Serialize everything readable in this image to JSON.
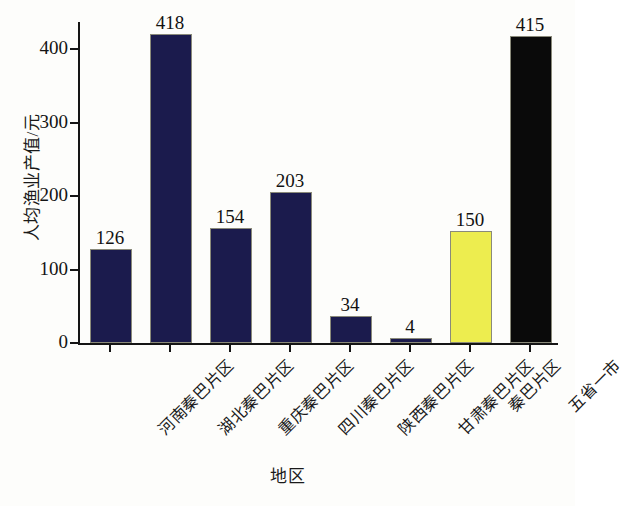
{
  "chart_data": {
    "type": "bar",
    "title": "",
    "xlabel": "地区",
    "ylabel": "人均渔业产值/元",
    "categories": [
      "河南秦巴片区",
      "湖北秦巴片区",
      "重庆秦巴片区",
      "四川秦巴片区",
      "陕西秦巴片区",
      "甘肃秦巴片区",
      "秦巴片区",
      "五省一市"
    ],
    "values": [
      126,
      418,
      154,
      203,
      34,
      4,
      150,
      415
    ],
    "value_labels": [
      "126",
      "418",
      "154",
      "203",
      "34",
      "4",
      "150",
      "415"
    ],
    "bar_colors": [
      "#1b1b4d",
      "#1b1b4d",
      "#1b1b4d",
      "#1b1b4d",
      "#1b1b4d",
      "#1b1b4d",
      "#eded4f",
      "#0a0a0a"
    ],
    "ylim": [
      0,
      440
    ],
    "yticks": [
      0,
      100,
      200,
      300,
      400
    ],
    "ytick_labels": [
      "0",
      "100",
      "200",
      "300",
      "400"
    ],
    "grid": false,
    "legend": null,
    "legend_position": "none",
    "xtick_label_rotation": 45
  }
}
